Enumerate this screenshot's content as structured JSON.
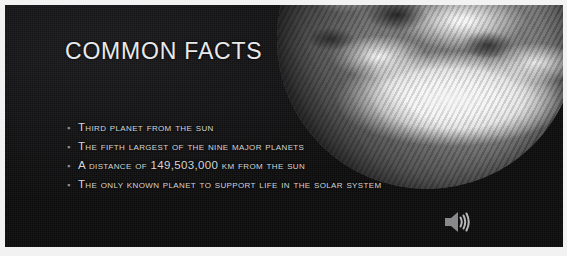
{
  "slide": {
    "title": "COMMON FACTS",
    "bullet_marker": "▪",
    "bullets": [
      {
        "text": "Third planet from the sun"
      },
      {
        "text": "The fifth largest of the nine major planets"
      },
      {
        "text": "A distance of 149,503,000 km from the sun"
      },
      {
        "text": "The only known planet to support life in the solar system"
      }
    ],
    "media": {
      "earth_image_alt": "Grayscale photograph of planet Earth",
      "audio_icon_name": "speaker-icon"
    },
    "colors": {
      "background": "#0a0a0a",
      "title_text": "#e9e9ea",
      "body_text": "#d6d6d8",
      "bullet_marker": "#8d8d90",
      "slide_border": "#f2f2f2",
      "speaker_icon": "#9a9a9c"
    }
  }
}
